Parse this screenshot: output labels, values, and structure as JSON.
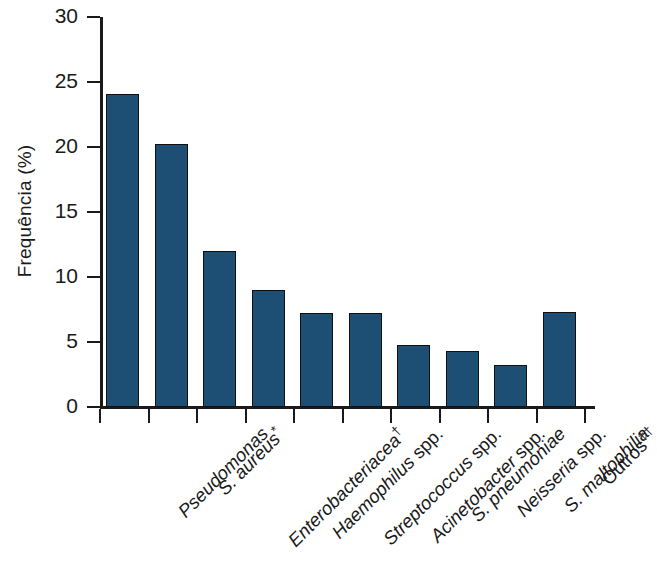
{
  "chart_data": {
    "type": "bar",
    "title": "",
    "subtitle": "",
    "xlabel": "",
    "ylabel": "Frequência (%)",
    "ylim": [
      0,
      30
    ],
    "ytick_labels": [
      "0",
      "5",
      "10",
      "15",
      "20",
      "25",
      "30"
    ],
    "ytick_values": [
      0,
      5,
      10,
      15,
      20,
      25,
      30
    ],
    "grid": false,
    "legend": null,
    "bar_color": "#1c4f73",
    "bar_edge_color": "#101010",
    "background_color": "#ffffff",
    "axis_color": "#1a1a1a",
    "categories": [
      "Pseudomonas",
      "S. aureus*",
      "Enterobacteriaceaᵗ",
      "Haemophilus spp.",
      "Streptococcus spp.",
      "Acinetobacter spp.",
      "S. pneumoniae",
      "Neisseria spp.",
      "S. maltophilia",
      "Outros††"
    ],
    "values": [
      24.1,
      20.2,
      12.0,
      9.0,
      7.2,
      7.2,
      4.8,
      4.3,
      3.2,
      7.3
    ],
    "bars": [
      {
        "label": "Pseudomonas",
        "label_main": "Pseudomonas",
        "marker": "",
        "italic": true,
        "value": 24.1
      },
      {
        "label": "S. aureus*",
        "label_main": "S. aureus",
        "marker": "*",
        "italic": true,
        "value": 20.2
      },
      {
        "label": "Enterobacteriacea†",
        "label_main": "Enterobacteriacea",
        "marker": "†",
        "italic": true,
        "value": 12.0
      },
      {
        "label": "Haemophilus spp.",
        "label_main": "Haemophilus",
        "marker": "",
        "italic": true,
        "value": 9.0,
        "suffix": " spp."
      },
      {
        "label": "Streptococcus spp.",
        "label_main": "Streptococcus",
        "marker": "",
        "italic": true,
        "value": 7.2,
        "suffix": " spp."
      },
      {
        "label": "Acinetobacter spp.",
        "label_main": "Acinetobacter",
        "marker": "",
        "italic": true,
        "value": 7.2,
        "suffix": " spp."
      },
      {
        "label": "S. pneumoniae",
        "label_main": "S. pneumoniae",
        "marker": "",
        "italic": true,
        "value": 4.8
      },
      {
        "label": "Neisseria spp.",
        "label_main": "Neisseria",
        "marker": "",
        "italic": true,
        "value": 4.3,
        "suffix": " spp."
      },
      {
        "label": "S. maltophilia",
        "label_main": "S. maltophilia",
        "marker": "",
        "italic": true,
        "value": 3.2
      },
      {
        "label": "Outros††",
        "label_main": "Outros",
        "marker": "††",
        "italic": false,
        "value": 7.3
      }
    ]
  }
}
